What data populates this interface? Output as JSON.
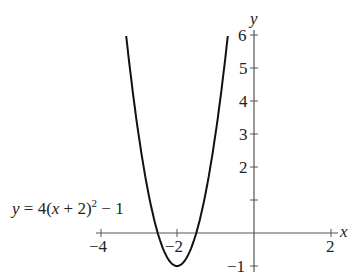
{
  "chart_data": {
    "type": "line",
    "title": "",
    "equation_label": "y = 4(x + 2)^2 - 1",
    "equation_parts": {
      "y": "y",
      "eq": " = 4(",
      "x": "x",
      "rest": " + 2)",
      "exp": "2",
      "tail": " − 1"
    },
    "xlabel": "x",
    "ylabel": "y",
    "xlim": [
      -4,
      2
    ],
    "ylim": [
      -1,
      6
    ],
    "x_ticks": [
      -4,
      -2,
      2
    ],
    "x_tick_labels": [
      "−4",
      "−2",
      "2"
    ],
    "y_ticks": [
      -1,
      1,
      2,
      3,
      4,
      5,
      6
    ],
    "y_tick_labels": [
      "−1",
      "",
      "2",
      "3",
      "4",
      "5",
      "6"
    ],
    "grid": false,
    "series": [
      {
        "name": "y = 4(x + 2)^2 - 1",
        "function": "4*(x+2)^2-1",
        "x": [
          -3.32,
          -3.0,
          -2.75,
          -2.5,
          -2.25,
          -2.0,
          -1.75,
          -1.5,
          -1.25,
          -1.0,
          -0.68
        ],
        "y": [
          6.0,
          3.0,
          1.25,
          0.0,
          -0.75,
          -1.0,
          -0.75,
          0.0,
          1.25,
          3.0,
          6.0
        ]
      }
    ],
    "vertex": [
      -2,
      -1
    ],
    "color": "#111111"
  }
}
